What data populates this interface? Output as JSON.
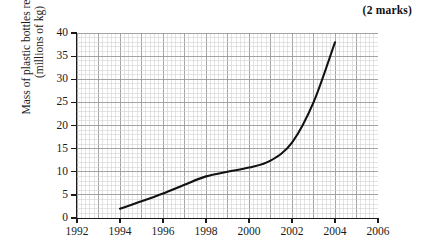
{
  "annotation": {
    "marks_label": "(2 marks)"
  },
  "chart_data": {
    "type": "line",
    "title": "",
    "xlabel": "",
    "ylabel": "Mass of plastic bottles recycled (millions of kg)",
    "ylabel_lines": [
      "Mass of plastic bottles recycled",
      "(millions of kg)"
    ],
    "xlim": [
      1992,
      2006
    ],
    "ylim": [
      0,
      40
    ],
    "grid": true,
    "grid_minor": true,
    "legend": "none",
    "x_ticks": [
      1992,
      1994,
      1996,
      1998,
      2000,
      2002,
      2004,
      2006
    ],
    "x_tick_labels": [
      "1992",
      "1994",
      "1996",
      "1998",
      "2000",
      "2002",
      "2004",
      "2006"
    ],
    "y_ticks": [
      0,
      5,
      10,
      15,
      20,
      25,
      30,
      35,
      40
    ],
    "y_tick_labels": [
      "0",
      "5",
      "10",
      "15",
      "20",
      "25",
      "30",
      "35",
      "40"
    ],
    "x": [
      1994,
      1995,
      1996,
      1997,
      1998,
      1999,
      2000,
      2001,
      2002,
      2003,
      2004
    ],
    "values": [
      2.0,
      3.6,
      5.3,
      7.2,
      9.0,
      10.0,
      10.9,
      12.4,
      16.3,
      25.0,
      38.0
    ],
    "series": [
      {
        "name": "Mass of plastic bottles recycled",
        "values": [
          2.0,
          3.6,
          5.3,
          7.2,
          9.0,
          10.0,
          10.9,
          12.4,
          16.3,
          25.0,
          38.0
        ],
        "color": "#111111"
      }
    ],
    "colors": {
      "curve": "#111111",
      "axis": "#1a1a1a",
      "grid_minor": "#d2d2d2",
      "grid_major": "#9a9a9a",
      "background": "#ffffff"
    }
  }
}
